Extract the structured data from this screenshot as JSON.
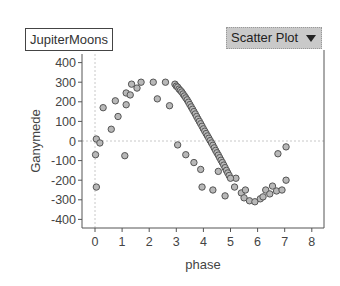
{
  "header": {
    "dataset_label": "JupiterMoons",
    "plot_type_label": "Scatter Plot",
    "plot_type_icon": "chevron-down-icon"
  },
  "chart_data": {
    "type": "scatter",
    "title": "",
    "xlabel": "phase",
    "ylabel": "Ganymede",
    "xlim": [
      -0.4,
      8.6
    ],
    "ylim": [
      -450,
      420
    ],
    "xticks": [
      0,
      1,
      2,
      3,
      4,
      5,
      6,
      7,
      8
    ],
    "yticks": [
      400,
      300,
      200,
      100,
      0,
      -100,
      -200,
      -300,
      -400
    ],
    "grid": false,
    "reference_lines": {
      "x": 0,
      "y": 0
    },
    "series": [
      {
        "name": "JupiterMoons",
        "points": [
          [
            0.05,
            10
          ],
          [
            0.18,
            -10
          ],
          [
            0.02,
            -70
          ],
          [
            0.05,
            -235
          ],
          [
            0.3,
            170
          ],
          [
            0.6,
            60
          ],
          [
            0.85,
            125
          ],
          [
            0.75,
            205
          ],
          [
            1.15,
            185
          ],
          [
            1.15,
            245
          ],
          [
            1.3,
            235
          ],
          [
            1.35,
            290
          ],
          [
            1.55,
            270
          ],
          [
            1.7,
            300
          ],
          [
            2.15,
            300
          ],
          [
            2.3,
            215
          ],
          [
            2.6,
            300
          ],
          [
            2.75,
            180
          ],
          [
            1.1,
            -75
          ],
          [
            3.05,
            -20
          ],
          [
            3.35,
            -70
          ],
          [
            3.65,
            -110
          ],
          [
            3.9,
            -145
          ],
          [
            3.95,
            -235
          ],
          [
            4.35,
            -250
          ],
          [
            4.8,
            -280
          ],
          [
            4.55,
            -155
          ],
          [
            5.2,
            -190
          ],
          [
            5.15,
            -235
          ],
          [
            5.4,
            -265
          ],
          [
            5.55,
            -250
          ],
          [
            5.5,
            -290
          ],
          [
            5.7,
            -305
          ],
          [
            5.9,
            -310
          ],
          [
            6.1,
            -295
          ],
          [
            6.2,
            -285
          ],
          [
            6.3,
            -250
          ],
          [
            6.55,
            -230
          ],
          [
            6.7,
            -255
          ],
          [
            6.75,
            -65
          ],
          [
            7.05,
            -30
          ],
          [
            7.05,
            -200
          ],
          [
            6.9,
            -250
          ],
          [
            6.45,
            -270
          ],
          [
            2.95,
            290
          ],
          [
            3.0,
            280
          ],
          [
            3.05,
            275
          ],
          [
            3.1,
            265
          ],
          [
            3.15,
            258
          ],
          [
            3.2,
            250
          ],
          [
            3.25,
            240
          ],
          [
            3.3,
            230
          ],
          [
            3.35,
            220
          ],
          [
            3.4,
            210
          ],
          [
            3.45,
            198
          ],
          [
            3.5,
            186
          ],
          [
            3.55,
            174
          ],
          [
            3.6,
            162
          ],
          [
            3.65,
            150
          ],
          [
            3.7,
            138
          ],
          [
            3.75,
            125
          ],
          [
            3.8,
            112
          ],
          [
            3.85,
            100
          ],
          [
            3.9,
            88
          ],
          [
            3.95,
            75
          ],
          [
            4.0,
            62
          ],
          [
            4.05,
            50
          ],
          [
            4.1,
            38
          ],
          [
            4.15,
            26
          ],
          [
            4.2,
            14
          ],
          [
            4.25,
            2
          ],
          [
            4.3,
            -10
          ],
          [
            4.35,
            -22
          ],
          [
            4.4,
            -35
          ],
          [
            4.45,
            -48
          ],
          [
            4.5,
            -60
          ],
          [
            4.55,
            -72
          ],
          [
            4.6,
            -85
          ],
          [
            4.65,
            -98
          ],
          [
            4.7,
            -110
          ],
          [
            4.75,
            -123
          ],
          [
            4.8,
            -136
          ],
          [
            4.85,
            -150
          ],
          [
            4.9,
            -163
          ],
          [
            4.95,
            -176
          ],
          [
            5.0,
            -190
          ]
        ]
      }
    ]
  }
}
